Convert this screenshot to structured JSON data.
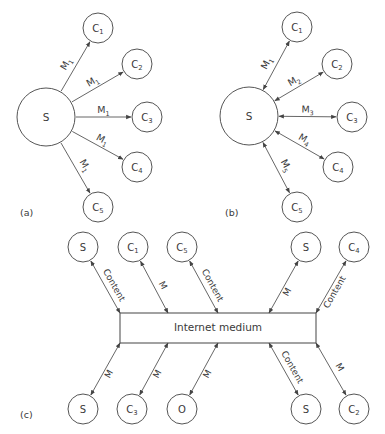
{
  "colors": {
    "stroke": "#555555",
    "text": "#3a3a3a",
    "background": "#ffffff"
  },
  "panels": [
    {
      "id": "a",
      "label": "(a)",
      "label_pos": [
        20,
        216
      ],
      "server": {
        "label": "S",
        "cx": 46,
        "cy": 117,
        "r": 29
      },
      "clients": [
        {
          "label": "C",
          "sub": "1",
          "cx": 98,
          "cy": 28,
          "r": 15,
          "edge_label": "M",
          "edge_sub": "1"
        },
        {
          "label": "C",
          "sub": "2",
          "cx": 137,
          "cy": 64,
          "r": 15,
          "edge_label": "M",
          "edge_sub": "1"
        },
        {
          "label": "C",
          "sub": "3",
          "cx": 147,
          "cy": 117,
          "r": 15,
          "edge_label": "M",
          "edge_sub": "1"
        },
        {
          "label": "C",
          "sub": "4",
          "cx": 137,
          "cy": 167,
          "r": 15,
          "edge_label": "M",
          "edge_sub": "1"
        },
        {
          "label": "C",
          "sub": "5",
          "cx": 98,
          "cy": 207,
          "r": 15,
          "edge_label": "M",
          "edge_sub": "1"
        }
      ],
      "direction": "one-way"
    },
    {
      "id": "b",
      "label": "(b)",
      "label_pos": [
        225,
        216
      ],
      "server": {
        "label": "S",
        "cx": 249,
        "cy": 116,
        "r": 29
      },
      "clients": [
        {
          "label": "C",
          "sub": "1",
          "cx": 297,
          "cy": 27,
          "r": 15,
          "edge_label": "M",
          "edge_sub": "1"
        },
        {
          "label": "C",
          "sub": "2",
          "cx": 337,
          "cy": 64,
          "r": 15,
          "edge_label": "M",
          "edge_sub": "2"
        },
        {
          "label": "C",
          "sub": "3",
          "cx": 352,
          "cy": 117,
          "r": 15,
          "edge_label": "M",
          "edge_sub": "3"
        },
        {
          "label": "C",
          "sub": "4",
          "cx": 338,
          "cy": 167,
          "r": 15,
          "edge_label": "M",
          "edge_sub": "4"
        },
        {
          "label": "C",
          "sub": "5",
          "cx": 297,
          "cy": 207,
          "r": 15,
          "edge_label": "M",
          "edge_sub": "5"
        }
      ],
      "direction": "two-way"
    }
  ],
  "panel_c": {
    "label": "(c)",
    "label_pos": [
      20,
      418
    ],
    "medium": {
      "label": "Internet medium",
      "x": 120,
      "y": 313,
      "w": 196,
      "h": 30
    },
    "top_nodes": [
      {
        "label": "S",
        "sub": "",
        "cx": 83,
        "cy": 247,
        "r": 15,
        "attach_x": 120,
        "edge_label": "Content"
      },
      {
        "label": "C",
        "sub": "1",
        "cx": 133,
        "cy": 247,
        "r": 15,
        "attach_x": 168,
        "edge_label": "M"
      },
      {
        "label": "C",
        "sub": "5",
        "cx": 182,
        "cy": 247,
        "r": 15,
        "attach_x": 218,
        "edge_label": "Content"
      },
      {
        "label": "S",
        "sub": "",
        "cx": 306,
        "cy": 247,
        "r": 15,
        "attach_x": 269,
        "edge_label": "M"
      },
      {
        "label": "C",
        "sub": "4",
        "cx": 354,
        "cy": 247,
        "r": 15,
        "attach_x": 316,
        "edge_label": "Content"
      }
    ],
    "bottom_nodes": [
      {
        "label": "S",
        "sub": "",
        "cx": 83,
        "cy": 409,
        "r": 15,
        "attach_x": 120,
        "edge_label": "M"
      },
      {
        "label": "C",
        "sub": "3",
        "cx": 132,
        "cy": 409,
        "r": 15,
        "attach_x": 168,
        "edge_label": "M"
      },
      {
        "label": "O",
        "sub": "",
        "cx": 182,
        "cy": 409,
        "r": 15,
        "attach_x": 218,
        "edge_label": "M"
      },
      {
        "label": "S",
        "sub": "",
        "cx": 306,
        "cy": 409,
        "r": 15,
        "attach_x": 269,
        "edge_label": "Content"
      },
      {
        "label": "C",
        "sub": "2",
        "cx": 354,
        "cy": 409,
        "r": 15,
        "attach_x": 316,
        "edge_label": "M"
      }
    ]
  }
}
